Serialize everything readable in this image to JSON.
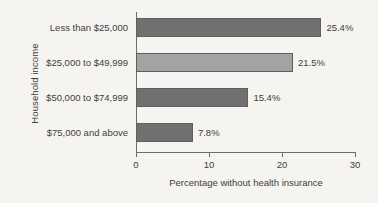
{
  "chart_data": {
    "type": "bar",
    "orientation": "horizontal",
    "title": "",
    "xlabel": "Percentage without health insurance",
    "ylabel": "Household income",
    "categories": [
      "Less than $25,000",
      "$25,000 to $49,999",
      "$50,000 to $74,999",
      "$75,000 and above"
    ],
    "values": [
      25.4,
      21.5,
      15.4,
      7.8
    ],
    "value_labels": [
      "25.4%",
      "21.5%",
      "15.4%",
      "7.8%"
    ],
    "bar_colors": [
      "#707070",
      "#a3a3a3",
      "#707070",
      "#707070"
    ],
    "bar_border_color": "#5e5e5e",
    "xlim": [
      0,
      30
    ],
    "xticks": [
      0,
      10,
      20,
      30
    ],
    "xtick_labels": [
      "0",
      "10",
      "20",
      "30"
    ],
    "grid": false,
    "legend": null,
    "background_color": "#f6f4f1",
    "axis_color": "#6d6d6d",
    "text_color": "#3d3d3d"
  }
}
